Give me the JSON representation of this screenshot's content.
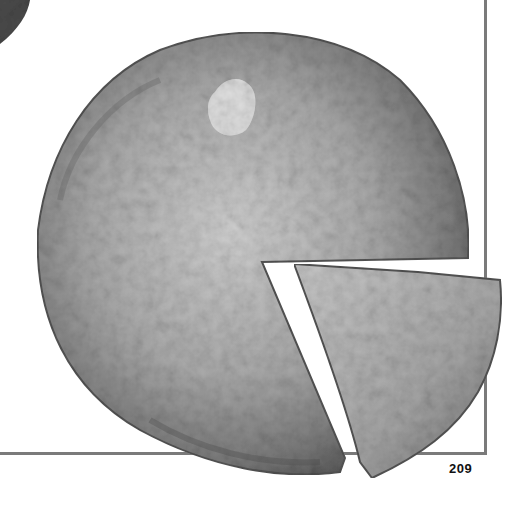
{
  "page": {
    "page_number": "209",
    "frame_color": "#7a7a7a",
    "background": "#ffffff"
  },
  "photo": {
    "subject": "frittata with cut wedge",
    "style": "grayscale",
    "elements": [
      "frittata-whole",
      "frittata-wedge",
      "corner-object"
    ]
  }
}
